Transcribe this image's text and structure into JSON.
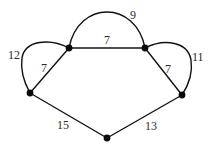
{
  "diagram": {
    "type": "weighted-multigraph",
    "nodes": [
      {
        "id": "A",
        "x": 69,
        "y": 48
      },
      {
        "id": "B",
        "x": 145,
        "y": 48
      },
      {
        "id": "C",
        "x": 30,
        "y": 93
      },
      {
        "id": "D",
        "x": 182,
        "y": 95
      },
      {
        "id": "E",
        "x": 107,
        "y": 138
      }
    ],
    "edges": [
      {
        "from": "A",
        "to": "B",
        "weight": "9",
        "shape": "arc-top"
      },
      {
        "from": "A",
        "to": "B",
        "weight": "7",
        "shape": "straight"
      },
      {
        "from": "A",
        "to": "C",
        "weight": "12",
        "shape": "arc-left"
      },
      {
        "from": "A",
        "to": "C",
        "weight": "7",
        "shape": "straight"
      },
      {
        "from": "B",
        "to": "D",
        "weight": "11",
        "shape": "arc-right"
      },
      {
        "from": "B",
        "to": "D",
        "weight": "7",
        "shape": "straight"
      },
      {
        "from": "C",
        "to": "E",
        "weight": "15",
        "shape": "straight"
      },
      {
        "from": "D",
        "to": "E",
        "weight": "13",
        "shape": "straight"
      }
    ],
    "labels": {
      "ab_arc": "9",
      "ab_straight": "7",
      "ac_arc": "12",
      "ac_straight": "7",
      "bd_arc": "11",
      "bd_straight": "7",
      "ce": "15",
      "de": "13"
    }
  }
}
